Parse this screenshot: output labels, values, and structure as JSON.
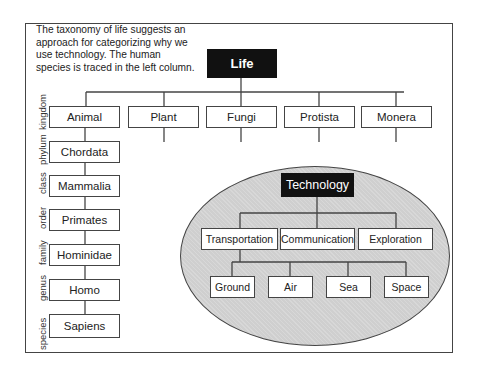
{
  "intro_text": "The taxonomy of life suggests an approach for categorizing why we use technology. The human species is traced in the left column.",
  "life": {
    "root": "Life",
    "kingdoms": [
      "Animal",
      "Plant",
      "Fungi",
      "Protista",
      "Monera"
    ],
    "human_lineage": [
      "Animal",
      "Chordata",
      "Mammalia",
      "Primates",
      "Hominidae",
      "Homo",
      "Sapiens"
    ],
    "ranks": [
      "kingdom",
      "phylum",
      "class",
      "order",
      "family",
      "genus",
      "species"
    ]
  },
  "technology": {
    "root": "Technology",
    "categories": [
      "Transportation",
      "Communication",
      "Exploration"
    ],
    "transportation_modes": [
      "Ground",
      "Air",
      "Sea",
      "Space"
    ],
    "fill_color": "#cfcfcf"
  }
}
